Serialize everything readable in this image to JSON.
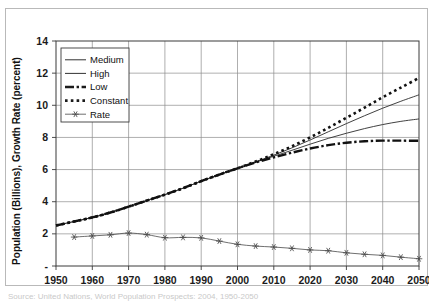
{
  "figure": {
    "caption": "Source: United Nations, World Population Prospects: 2004, 1950-2050"
  },
  "chart_data": {
    "type": "line",
    "title": "",
    "xlabel": "",
    "ylabel": "Population (Billions), Growth Rate (percent)",
    "xlim": [
      1950,
      2050
    ],
    "ylim": [
      0,
      14
    ],
    "ytick_labels": [
      "14",
      "12",
      "10",
      "8",
      "6",
      "4",
      "2",
      "-"
    ],
    "yticks": [
      14,
      12,
      10,
      8,
      6,
      4,
      2,
      0
    ],
    "xtick_labels": [
      "1950",
      "1960",
      "1970",
      "1980",
      "1990",
      "2000",
      "2010",
      "2020",
      "2030",
      "2040",
      "2050"
    ],
    "xticks": [
      1950,
      1960,
      1970,
      1980,
      1990,
      2000,
      2010,
      2020,
      2030,
      2040,
      2050
    ],
    "grid": true,
    "legend_position": "upper-left",
    "series": [
      {
        "name": "Medium",
        "style": "thin-solid",
        "color": "#2b2b2b",
        "x": [
          1950,
          1955,
          1960,
          1965,
          1970,
          1975,
          1980,
          1985,
          1990,
          1995,
          2000,
          2005,
          2010,
          2015,
          2020,
          2025,
          2030,
          2035,
          2040,
          2045,
          2050
        ],
        "values": [
          2.52,
          2.77,
          3.02,
          3.33,
          3.69,
          4.07,
          4.44,
          4.84,
          5.28,
          5.69,
          6.08,
          6.46,
          6.83,
          7.2,
          7.58,
          7.94,
          8.26,
          8.55,
          8.8,
          9.0,
          9.15
        ]
      },
      {
        "name": "High",
        "style": "thin-solid",
        "color": "#2b2b2b",
        "x": [
          1950,
          1955,
          1960,
          1965,
          1970,
          1975,
          1980,
          1985,
          1990,
          1995,
          2000,
          2005,
          2010,
          2015,
          2020,
          2025,
          2030,
          2035,
          2040,
          2045,
          2050
        ],
        "values": [
          2.52,
          2.77,
          3.02,
          3.33,
          3.69,
          4.07,
          4.44,
          4.84,
          5.28,
          5.69,
          6.08,
          6.48,
          6.9,
          7.35,
          7.84,
          8.35,
          8.86,
          9.35,
          9.82,
          10.25,
          10.65
        ]
      },
      {
        "name": "Low",
        "style": "thick-dash-dot",
        "color": "#111111",
        "x": [
          1950,
          1955,
          1960,
          1965,
          1970,
          1975,
          1980,
          1985,
          1990,
          1995,
          2000,
          2005,
          2010,
          2015,
          2020,
          2025,
          2030,
          2035,
          2040,
          2045,
          2050
        ],
        "values": [
          2.52,
          2.77,
          3.02,
          3.33,
          3.69,
          4.07,
          4.44,
          4.84,
          5.28,
          5.69,
          6.08,
          6.44,
          6.76,
          7.05,
          7.31,
          7.52,
          7.67,
          7.76,
          7.8,
          7.8,
          7.79
        ]
      },
      {
        "name": "Constant",
        "style": "thick-dotted",
        "color": "#111111",
        "x": [
          1950,
          1955,
          1960,
          1965,
          1970,
          1975,
          1980,
          1985,
          1990,
          1995,
          2000,
          2005,
          2010,
          2015,
          2020,
          2025,
          2030,
          2035,
          2040,
          2045,
          2050
        ],
        "values": [
          2.52,
          2.77,
          3.02,
          3.33,
          3.69,
          4.07,
          4.44,
          4.84,
          5.28,
          5.69,
          6.08,
          6.5,
          6.95,
          7.45,
          8.0,
          8.6,
          9.22,
          9.85,
          10.5,
          11.1,
          11.7
        ]
      },
      {
        "name": "Rate",
        "style": "thin-solid-star-markers",
        "color": "#4a4a4a",
        "x": [
          1955,
          1960,
          1965,
          1970,
          1975,
          1980,
          1985,
          1990,
          1995,
          2000,
          2005,
          2010,
          2015,
          2020,
          2025,
          2030,
          2035,
          2040,
          2045,
          2050
        ],
        "values": [
          1.8,
          1.87,
          1.94,
          2.05,
          1.95,
          1.76,
          1.78,
          1.75,
          1.55,
          1.35,
          1.24,
          1.18,
          1.1,
          1.0,
          0.95,
          0.82,
          0.73,
          0.66,
          0.55,
          0.45
        ]
      }
    ]
  },
  "legend": {
    "entries": [
      {
        "label": "Medium",
        "style": "thin-solid"
      },
      {
        "label": "High",
        "style": "thin-solid"
      },
      {
        "label": "Low",
        "style": "thick-dash-dot"
      },
      {
        "label": "Constant",
        "style": "thick-dotted"
      },
      {
        "label": "Rate",
        "style": "thin-solid-star-markers"
      }
    ]
  },
  "colors": {
    "grid": "#8d8d8d",
    "axis": "#3a3a3a",
    "text": "#111111",
    "frame": "#b9b9b9"
  }
}
